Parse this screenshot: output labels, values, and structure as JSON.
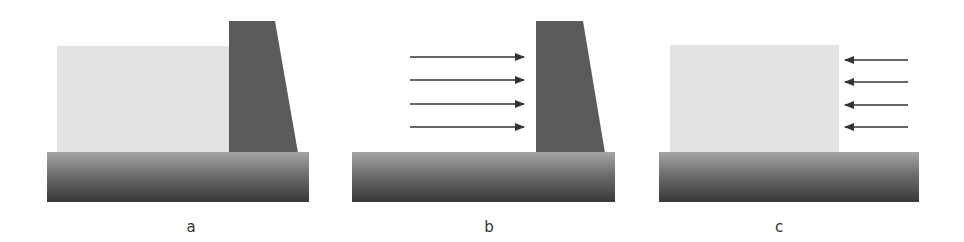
{
  "colors": {
    "background": "#ffffff",
    "water_fill": "#e3e3e3",
    "dam_fill": "#5b5b5b",
    "ground_top": "#a6a6a6",
    "ground_bottom": "#383838",
    "arrow": "#333333",
    "label": "#333333"
  },
  "panels": [
    {
      "id": "a",
      "label": "a",
      "description": "water retained behind gravity dam on ground",
      "has_water": true,
      "has_dam": true,
      "arrows": "none"
    },
    {
      "id": "b",
      "label": "b",
      "description": "hydrostatic pressure arrows pushing on dam",
      "has_water": false,
      "has_dam": true,
      "arrows": "right-pointing, 4 arrows"
    },
    {
      "id": "c",
      "label": "c",
      "description": "reaction pressure arrows pushing on water body",
      "has_water": true,
      "has_dam": false,
      "arrows": "left-pointing, 4 arrows"
    }
  ]
}
